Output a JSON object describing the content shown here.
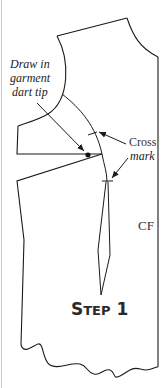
{
  "diagram": {
    "title_first": "S",
    "title_rest": "TEP",
    "title_number": "1",
    "labels": {
      "dart_tip_line1": "Draw in",
      "dart_tip_line2": "garment",
      "dart_tip_line3": "dart tip",
      "cross_mark_line1": "Cross",
      "cross_mark_line2": "mark",
      "center_front": "CF"
    },
    "colors": {
      "line": "#1a1a1a",
      "border": "#c8c8c8",
      "background": "#ffffff"
    }
  }
}
